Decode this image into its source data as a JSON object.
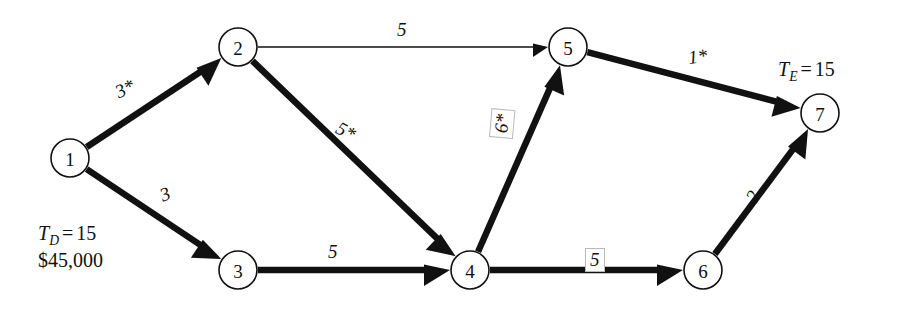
{
  "chart_data": {
    "type": "diagram",
    "title": "",
    "subtitle": "",
    "diagram_kind": "activity-on-arrow project network (CPM)",
    "nodes": [
      {
        "id": "1",
        "label": "1",
        "x": 70,
        "y": 158,
        "r": 19
      },
      {
        "id": "2",
        "label": "2",
        "x": 238,
        "y": 47,
        "r": 19
      },
      {
        "id": "3",
        "label": "3",
        "x": 238,
        "y": 270,
        "r": 19
      },
      {
        "id": "4",
        "label": "4",
        "x": 470,
        "y": 270,
        "r": 19
      },
      {
        "id": "5",
        "label": "5",
        "x": 568,
        "y": 47,
        "r": 19
      },
      {
        "id": "6",
        "label": "6",
        "x": 703,
        "y": 270,
        "r": 19
      },
      {
        "id": "7",
        "label": "7",
        "x": 820,
        "y": 113,
        "r": 19
      }
    ],
    "edges": [
      {
        "from": "1",
        "to": "2",
        "label": "3*",
        "critical": true,
        "weight": 3,
        "style": "thick",
        "label_x": 112,
        "label_y": 84,
        "label_rot": -26,
        "boxed": false
      },
      {
        "from": "1",
        "to": "3",
        "label": "3",
        "critical": true,
        "weight": 3,
        "style": "thick",
        "label_x": 157,
        "label_y": 187,
        "label_rot": -22,
        "boxed": false
      },
      {
        "from": "2",
        "to": "5",
        "label": "5",
        "critical": false,
        "weight": 5,
        "style": "thin",
        "label_x": 397,
        "label_y": 20,
        "label_rot": 0,
        "boxed": false
      },
      {
        "from": "2",
        "to": "4",
        "label": "5*",
        "critical": true,
        "weight": 5,
        "style": "thick",
        "label_x": 342,
        "label_y": 118,
        "label_rot": 28,
        "boxed": false
      },
      {
        "from": "3",
        "to": "4",
        "label": "5",
        "critical": true,
        "weight": 5,
        "style": "thick",
        "label_x": 328,
        "label_y": 242,
        "label_rot": 0,
        "boxed": false
      },
      {
        "from": "4",
        "to": "5",
        "label": "6*",
        "critical": true,
        "weight": 6,
        "style": "thick",
        "label_x": 489,
        "label_y": 137,
        "label_rot": -85,
        "boxed": true
      },
      {
        "from": "4",
        "to": "6",
        "label": "5",
        "critical": true,
        "weight": 5,
        "style": "thick",
        "label_x": 585,
        "label_y": 248,
        "label_rot": 0,
        "boxed": true
      },
      {
        "from": "5",
        "to": "7",
        "label": "1*",
        "critical": true,
        "weight": 1,
        "style": "thick",
        "label_x": 687,
        "label_y": 48,
        "label_rot": -7,
        "boxed": false
      },
      {
        "from": "6",
        "to": "7",
        "label": "2",
        "critical": true,
        "weight": 2,
        "style": "thick",
        "label_x": 742,
        "label_y": 196,
        "label_rot": -62,
        "boxed": false
      }
    ],
    "annotations": [
      {
        "id": "te",
        "symbol": "T",
        "subscript": "E",
        "equals": "=",
        "value": "15",
        "x": 778,
        "y": 58
      },
      {
        "id": "td",
        "symbol": "T",
        "subscript": "D",
        "equals": "=",
        "value": "15",
        "cost": "$45,000",
        "x": 38,
        "y": 222
      }
    ],
    "notes": {
      "asterisk_meaning": "critical-path activity marker",
      "legend_position": "none",
      "grid": false
    }
  }
}
